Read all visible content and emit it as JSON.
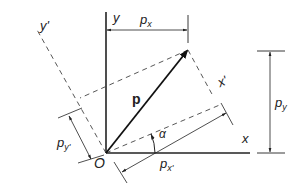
{
  "figure": {
    "panel_label": "(b)",
    "labels": {
      "y_axis": "y",
      "x_axis": "x",
      "y_prime_axis": "y'",
      "x_prime_axis": "x'",
      "origin": "O",
      "vector": "p",
      "angle": "α",
      "px": "p",
      "px_sub": "x",
      "py": "p",
      "py_sub": "y",
      "pxp": "p",
      "pxp_sub": "x'",
      "pyp": "p",
      "pyp_sub": "y'"
    },
    "colors": {
      "line": "#222222",
      "dashed": "#444444"
    }
  }
}
